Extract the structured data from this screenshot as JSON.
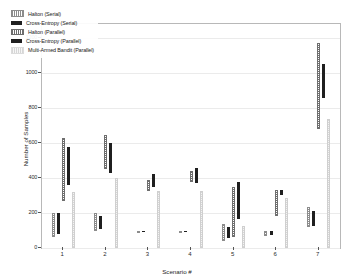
{
  "chart_data": {
    "type": "bar",
    "title": "",
    "xlabel": "Scenario #",
    "ylabel": "Number of Samples",
    "categories": [
      "1",
      "2",
      "3",
      "4",
      "5",
      "6",
      "7"
    ],
    "xlim": [
      0.5,
      7.5
    ],
    "ylim": [
      0,
      1280
    ],
    "yticks": [
      0,
      200,
      400,
      600,
      800,
      1000,
      1200
    ],
    "ytick_labels": [
      "0",
      "200",
      "400",
      "600",
      "800",
      "1000",
      "1200"
    ],
    "grid": true,
    "grid_axis": "y",
    "legend_position": "upper-left",
    "note": "Each bar is a floating range bar (low to high) showing spread of number of samples.",
    "series": [
      {
        "name": "Halton (Serial)",
        "color": "#8c8c8c",
        "pattern": "hatched",
        "low": [
          65,
          95,
          88,
          88,
          38,
          68,
          120
        ],
        "high": [
          200,
          198,
          100,
          98,
          135,
          98,
          232
        ]
      },
      {
        "name": "Cross-Entropy (Serial)",
        "color": "#1f1f1f",
        "pattern": "solid",
        "low": [
          78,
          108,
          90,
          92,
          58,
          76,
          128
        ],
        "high": [
          200,
          182,
          100,
          98,
          120,
          95,
          212
        ]
      },
      {
        "name": "Halton (Parallel)",
        "color": "#6e6e6e",
        "pattern": "hatched",
        "low": [
          268,
          452,
          325,
          378,
          60,
          182,
          680
        ],
        "high": [
          628,
          648,
          390,
          442,
          348,
          330,
          1172
        ]
      },
      {
        "name": "Cross-Entropy (Parallel)",
        "color": "#1f1f1f",
        "pattern": "solid",
        "low": [
          362,
          428,
          348,
          372,
          168,
          300,
          858
        ],
        "high": [
          578,
          598,
          425,
          455,
          375,
          332,
          1052
        ]
      },
      {
        "name": "Multi-Armed Bandit (Parallel)",
        "color": "#d6d6d6",
        "pattern": "light",
        "low": [
          0,
          0,
          0,
          0,
          0,
          0,
          0
        ],
        "high": [
          322,
          400,
          328,
          328,
          125,
          285,
          735
        ]
      }
    ]
  },
  "axis": {
    "ylabel": "Number of Samples",
    "xlabel": "Scenario #"
  }
}
